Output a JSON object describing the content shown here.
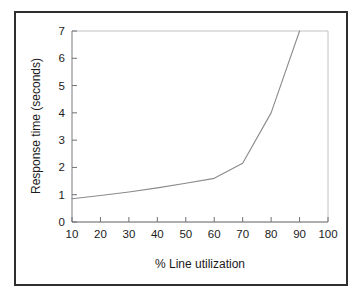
{
  "figure": {
    "frame_color": "#2e2e30",
    "background_color": "#ffffff",
    "plot_border_color": "#b9b9bc",
    "line_color": "#8a8a8f",
    "tick_color": "#6f6f74",
    "text_color": "#1b1b1b"
  },
  "chart_data": {
    "type": "line",
    "title": "",
    "xlabel": "% Line utilization",
    "ylabel": "Response time (seconds)",
    "xlim": [
      10,
      100
    ],
    "ylim": [
      0,
      7
    ],
    "xticks": [
      10,
      20,
      30,
      40,
      50,
      60,
      70,
      80,
      90,
      100
    ],
    "xtick_labels": [
      "10",
      "20",
      "30",
      "40",
      "50",
      "60",
      "70",
      "80",
      "90",
      "100"
    ],
    "yticks": [
      0,
      1,
      2,
      3,
      4,
      5,
      6,
      7
    ],
    "ytick_labels": [
      "0",
      "1",
      "2",
      "3",
      "4",
      "5",
      "6",
      "7"
    ],
    "grid": false,
    "legend": null,
    "legend_position": "none",
    "series": [
      {
        "name": "Response time vs line utilization",
        "x": [
          10,
          20,
          30,
          40,
          50,
          60,
          70,
          80,
          90
        ],
        "values": [
          0.85,
          0.97,
          1.1,
          1.25,
          1.42,
          1.6,
          2.15,
          4.0,
          7.0
        ]
      }
    ],
    "annotations": []
  }
}
